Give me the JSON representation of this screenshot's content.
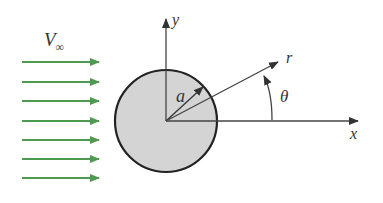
{
  "diagram": {
    "labels": {
      "freestream": "V",
      "freestream_sub": "∞",
      "radius": "a",
      "radial": "r",
      "angle": "θ",
      "x_axis": "x",
      "y_axis": "y"
    },
    "colors": {
      "flow_arrows": "#4e9a4e",
      "cylinder_fill": "#d4d4d4",
      "cylinder_stroke": "#222222",
      "axes": "#444444"
    },
    "flow_arrow_count": 7
  }
}
